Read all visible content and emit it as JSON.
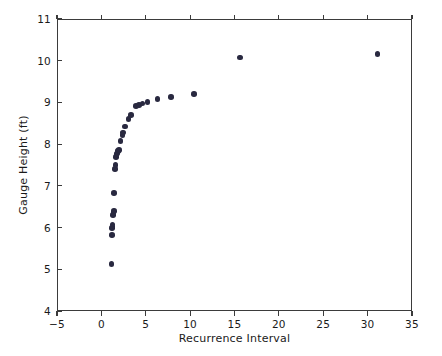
{
  "chart_data": {
    "type": "scatter",
    "title": "",
    "xlabel": "Recurrence Interval",
    "ylabel": "Gauge Height (ft)",
    "xlim": [
      -5,
      35
    ],
    "ylim": [
      4,
      11
    ],
    "xticks": [
      -5,
      0,
      5,
      10,
      15,
      20,
      25,
      30,
      35
    ],
    "xticklabels": [
      "−5",
      "0",
      "5",
      "10",
      "15",
      "20",
      "25",
      "30",
      "35"
    ],
    "yticks": [
      4,
      5,
      6,
      7,
      8,
      9,
      10,
      11
    ],
    "yticklabels": [
      "4",
      "5",
      "6",
      "7",
      "8",
      "9",
      "10",
      "11"
    ],
    "grid": false,
    "legend": null,
    "marker": {
      "shape": "circle",
      "color": "#292940",
      "size_px": 5.6
    },
    "axes_color": "#3b3b3b",
    "background": "#ffffff",
    "series": [
      {
        "name": "Gauge Height vs Recurrence Interval",
        "points": [
          [
            1.03,
            5.15
          ],
          [
            1.08,
            5.85
          ],
          [
            1.1,
            6.02
          ],
          [
            1.13,
            6.05
          ],
          [
            1.16,
            6.1
          ],
          [
            1.2,
            6.33
          ],
          [
            1.24,
            6.38
          ],
          [
            1.28,
            6.42
          ],
          [
            1.33,
            6.85
          ],
          [
            1.45,
            7.43
          ],
          [
            1.5,
            7.52
          ],
          [
            1.55,
            7.72
          ],
          [
            1.6,
            7.76
          ],
          [
            1.65,
            7.8
          ],
          [
            1.7,
            7.83
          ],
          [
            1.78,
            7.86
          ],
          [
            1.88,
            7.88
          ],
          [
            2.05,
            8.1
          ],
          [
            2.25,
            8.25
          ],
          [
            2.35,
            8.3
          ],
          [
            2.55,
            8.45
          ],
          [
            2.95,
            8.62
          ],
          [
            3.2,
            8.72
          ],
          [
            3.8,
            8.94
          ],
          [
            4.1,
            8.96
          ],
          [
            4.5,
            9.0
          ],
          [
            5.1,
            9.04
          ],
          [
            6.2,
            9.11
          ],
          [
            7.7,
            9.16
          ],
          [
            10.3,
            9.23
          ],
          [
            15.5,
            10.1
          ],
          [
            31.0,
            10.18
          ]
        ]
      }
    ]
  }
}
